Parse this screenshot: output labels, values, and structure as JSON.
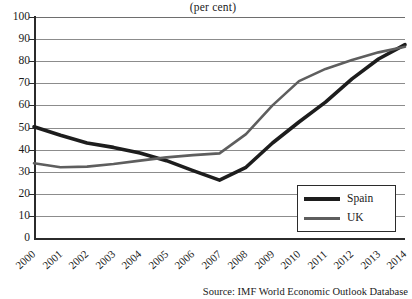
{
  "chart_data": {
    "type": "line",
    "title": "(per cent)",
    "xlabel": "",
    "ylabel": "",
    "ylim": [
      0,
      100
    ],
    "ytick_step": 10,
    "yticks": [
      0,
      10,
      20,
      30,
      40,
      50,
      60,
      70,
      80,
      90,
      100
    ],
    "grid": true,
    "legend_position": "bottom-right",
    "categories": [
      "2000",
      "2001",
      "2002",
      "2003",
      "2004",
      "2005",
      "2006",
      "2007",
      "2008",
      "2009",
      "2010",
      "2011",
      "2012",
      "2013",
      "2014"
    ],
    "series": [
      {
        "name": "Spain",
        "color": "#1d1d1d",
        "values": [
          50.3,
          46.5,
          43.0,
          41.0,
          38.5,
          35.0,
          30.5,
          26.2,
          32.0,
          43.0,
          52.5,
          61.5,
          72.0,
          81.0,
          87.5
        ]
      },
      {
        "name": "UK",
        "color": "#5e5e5e",
        "values": [
          33.8,
          32.0,
          32.3,
          33.5,
          35.0,
          36.5,
          37.5,
          38.3,
          47.0,
          60.0,
          71.0,
          76.5,
          80.5,
          84.0,
          86.5
        ]
      }
    ],
    "source": "Source: IMF World Economic Outlook Database"
  },
  "legend": {
    "items": [
      {
        "label": "Spain"
      },
      {
        "label": "UK"
      }
    ]
  }
}
